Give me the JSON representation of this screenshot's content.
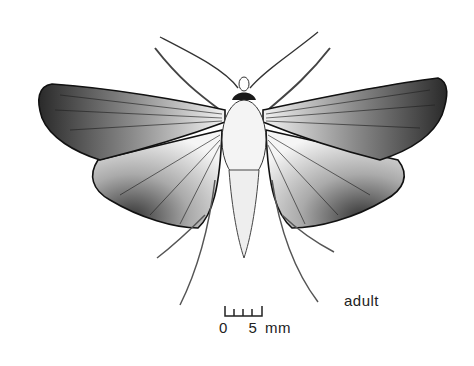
{
  "figure": {
    "stage_label": "adult",
    "scale_bar": {
      "start_label": "0",
      "end_label": "5",
      "unit": "mm",
      "ticks": 5
    }
  },
  "colors": {
    "background": "#ffffff",
    "ink": "#1a1a1a",
    "shade": "#555555"
  }
}
